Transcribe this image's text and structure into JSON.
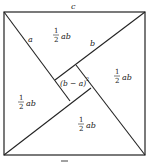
{
  "diagram": {
    "labels": {
      "c": "c",
      "a": "a",
      "b": "b",
      "inner_square": "(b − a)",
      "inner_square_exp": "2",
      "half_num": "1",
      "half_den": "2",
      "ab": "ab"
    },
    "triangles": [
      {
        "name": "top",
        "area": "1/2 ab"
      },
      {
        "name": "right",
        "area": "1/2 ab"
      },
      {
        "name": "bottom",
        "area": "1/2 ab"
      },
      {
        "name": "left",
        "area": "1/2 ab"
      }
    ],
    "stroke_color": "#222222"
  }
}
